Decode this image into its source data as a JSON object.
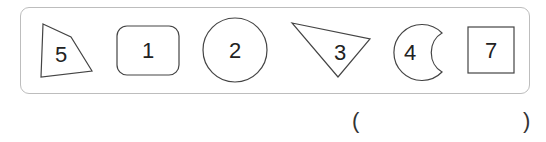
{
  "figure": {
    "shapes": [
      {
        "shape": "quadrilateral",
        "label": "5"
      },
      {
        "shape": "rounded-rectangle",
        "label": "1"
      },
      {
        "shape": "circle",
        "label": "2"
      },
      {
        "shape": "triangle",
        "label": "3"
      },
      {
        "shape": "crescent",
        "label": "4"
      },
      {
        "shape": "square",
        "label": "7"
      }
    ]
  },
  "answer": {
    "open_paren": "(",
    "value": "",
    "close_paren": ")"
  }
}
